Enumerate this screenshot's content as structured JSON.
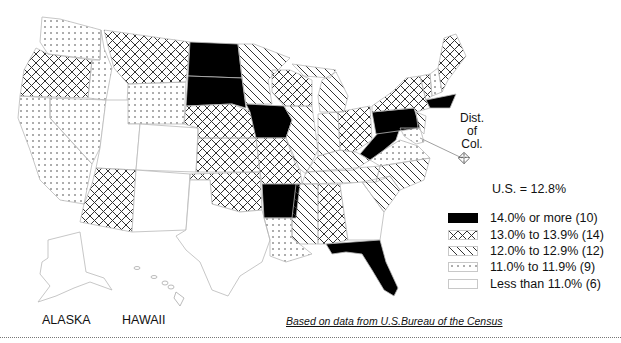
{
  "map": {
    "title_stat": "U.S. = 12.8%",
    "dc_label": [
      "Dist.",
      "of",
      "Col."
    ],
    "inset_labels": {
      "alaska": "ALASKA",
      "hawaii": "HAWAII"
    },
    "source": "Based on data from U.S.Bureau of the Census",
    "colors": {
      "solid": "#000000",
      "line": "#333333",
      "border": "#b9b9b9",
      "background": "#ffffff"
    }
  },
  "legend": {
    "items": [
      {
        "pattern": "solid",
        "label": "14.0% or more (10)"
      },
      {
        "pattern": "crosshatch",
        "label": "13.0% to 13.9% (14)"
      },
      {
        "pattern": "diagonal",
        "label": "12.0% to 12.9% (12)"
      },
      {
        "pattern": "dots",
        "label": "11.0% to 11.9% (9)"
      },
      {
        "pattern": "blank",
        "label": "Less than 11.0% (6)"
      }
    ]
  },
  "states": {
    "solid": [
      "North Dakota",
      "South Dakota",
      "Iowa",
      "Arkansas",
      "Florida",
      "Pennsylvania",
      "West Virginia",
      "Massachusetts",
      "Rhode Island",
      "Connecticut"
    ],
    "crosshatch": [
      "Oregon",
      "Montana",
      "Nebraska",
      "Kansas",
      "Oklahoma",
      "Missouri",
      "Arizona",
      "Wisconsin",
      "Ohio",
      "New York",
      "Vermont",
      "Maine",
      "Mississippi",
      "District of Columbia"
    ],
    "diagonal": [
      "Minnesota",
      "Michigan",
      "Illinois",
      "Indiana",
      "Kentucky",
      "Tennessee",
      "North Carolina",
      "South Carolina",
      "Alabama",
      "New Jersey",
      "Delaware",
      "Idaho"
    ],
    "dots": [
      "Washington",
      "Idaho-south",
      "Wyoming",
      "Nevada",
      "California",
      "Louisiana",
      "Virginia",
      "Maryland",
      "New Hampshire"
    ],
    "blank": [
      "Utah",
      "Colorado",
      "New Mexico",
      "Texas",
      "Georgia",
      "Alaska",
      "Hawaii"
    ]
  }
}
